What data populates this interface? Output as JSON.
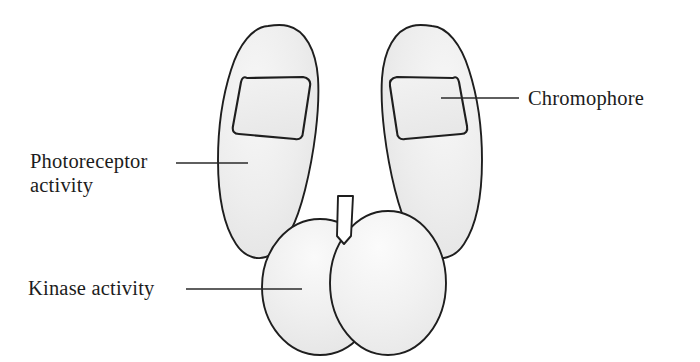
{
  "figure": {
    "kind": "biological-schematic",
    "background_color": "#ffffff",
    "outline_color": "#1e1e1e",
    "body_fill_color": "#ebebeb",
    "body_fill_highlight": "#f8f8f8",
    "chromophore_fill_color": "#ececec",
    "leader_line_color": "#2a2a2a"
  },
  "labels": [
    {
      "id": "photoreceptor",
      "name": "photoreceptor-activity-label",
      "lines": [
        "Photoreceptor",
        "activity"
      ],
      "text_x": 30,
      "line1_y": 168,
      "line2_y": 192,
      "anchor": "start",
      "leader": {
        "x1": 176,
        "y1": 163,
        "x2": 248,
        "y2": 163
      }
    },
    {
      "id": "kinase",
      "name": "kinase-activity-label",
      "lines": [
        "Kinase activity"
      ],
      "text_x": 28,
      "line1_y": 295,
      "line2_y": null,
      "anchor": "start",
      "leader": {
        "x1": 186,
        "y1": 289,
        "x2": 302,
        "y2": 289
      }
    },
    {
      "id": "chromophore",
      "name": "chromophore-label",
      "lines": [
        "Chromophore"
      ],
      "text_x": 528,
      "line1_y": 105,
      "line2_y": null,
      "anchor": "start",
      "leader": {
        "x1": 441,
        "y1": 98,
        "x2": 519,
        "y2": 98
      }
    }
  ],
  "shapes": {
    "left_lobe": {
      "name": "left-photoreceptor-lobe",
      "path": "M 268 26 C 253 27 239 44 231 70 C 222 98 218 130 218 160 C 218 196 224 226 236 244 C 245 258 260 262 272 254 C 286 245 297 222 305 190 C 314 154 320 110 318 78 C 316 50 305 30 288 26 C 281 24 274 25 268 26 Z"
    },
    "right_lobe": {
      "name": "right-photoreceptor-lobe",
      "path": "M 432 26 C 447 27 461 44 469 70 C 478 98 482 130 482 160 C 482 196 476 226 464 244 C 455 258 440 262 428 254 C 414 245 403 222 395 190 C 386 154 380 110 382 78 C 384 50 395 30 412 26 C 419 24 426 25 432 26 Z"
    },
    "left_chromophore": {
      "name": "left-chromophore-box",
      "path": "M 247 78 C 244 76 242 78 241 82 L 233 126 C 232 131 234 134 239 134 L 295 139 C 300 140 303 137 303 132 L 310 86 C 311 81 308 78 303 77 L 247 78 Z"
    },
    "right_chromophore": {
      "name": "right-chromophore-box",
      "path": "M 453 78 C 456 76 458 78 459 82 L 467 126 C 468 131 466 134 461 134 L 405 139 C 400 140 397 137 397 132 L 390 86 C 389 81 392 78 397 77 L 453 78 Z"
    },
    "left_kinase": {
      "name": "left-kinase-domain",
      "cx": 320,
      "cy": 287,
      "rx": 58,
      "ry": 68
    },
    "right_kinase": {
      "name": "right-kinase-domain",
      "cx": 388,
      "cy": 283,
      "rx": 58,
      "ry": 72
    },
    "notch": {
      "name": "dimer-interface-notch",
      "path": "M 338 196 L 353 196 L 351 236 L 344 244 L 337 236 Z"
    }
  }
}
